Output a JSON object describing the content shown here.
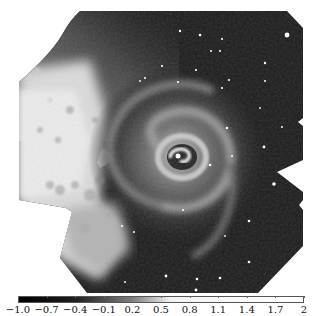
{
  "figure": {
    "type": "grayscale astronomical image with colorbar",
    "colors": {
      "background": "#ffffff",
      "field_dark": "#1a1a1a",
      "left_bright_region": "#e6e6e6",
      "nucleus": "#f0f0f0"
    }
  },
  "colorbar": {
    "orientation": "horizontal",
    "min": -1.0,
    "max": 2,
    "gradient_stops": [
      {
        "value": -1.0,
        "color": "#000000"
      },
      {
        "value": -0.4,
        "color": "#1e1e1e"
      },
      {
        "value": 0.2,
        "color": "#808080"
      },
      {
        "value": 0.6,
        "color": "#f2f2f2"
      },
      {
        "value": 2,
        "color": "#ffffff"
      }
    ],
    "ticks": [
      {
        "label": "−1.0",
        "value": -1.0
      },
      {
        "label": "−0.7",
        "value": -0.7
      },
      {
        "label": "−0.4",
        "value": -0.4
      },
      {
        "label": "−0.1",
        "value": -0.1
      },
      {
        "label": "0.2",
        "value": 0.2
      },
      {
        "label": "0.5",
        "value": 0.5
      },
      {
        "label": "0.8",
        "value": 0.8
      },
      {
        "label": "1.1",
        "value": 1.1
      },
      {
        "label": "1.4",
        "value": 1.4
      },
      {
        "label": "1.7",
        "value": 1.7
      },
      {
        "label": "2",
        "value": 2
      }
    ]
  }
}
